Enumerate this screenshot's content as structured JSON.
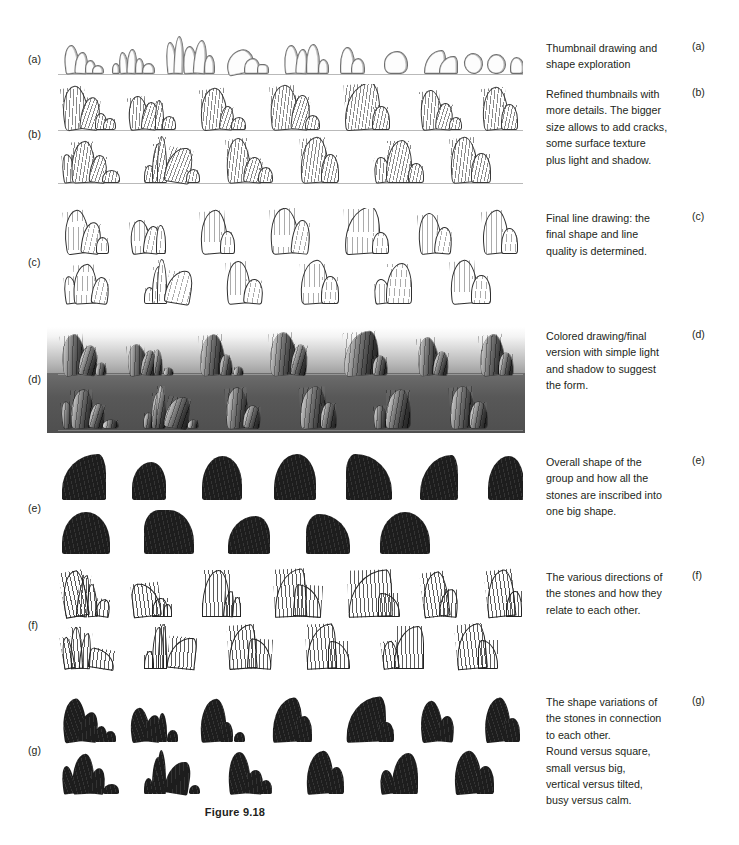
{
  "figure": {
    "label": "Figure 9.18"
  },
  "rows": [
    {
      "key": "a",
      "row_label": "(a)",
      "caption_letter": "(a)",
      "caption_lines": [
        "Thumbnail drawing and",
        "shape exploration"
      ],
      "art_style": "sketch"
    },
    {
      "key": "b",
      "row_label": "(b)",
      "caption_letter": "(b)",
      "caption_lines": [
        "Refined thumbnails with",
        "more details. The bigger",
        "size allows to add cracks,",
        "some surface texture",
        "plus light and shadow."
      ],
      "art_style": "refined"
    },
    {
      "key": "c",
      "row_label": "(c)",
      "caption_letter": "(c)",
      "caption_lines": [
        "Final line drawing: the",
        "final shape and line",
        "quality is determined."
      ],
      "art_style": "line-drawing"
    },
    {
      "key": "d",
      "row_label": "(d)",
      "caption_letter": "(d)",
      "caption_lines": [
        "Colored drawing/final",
        "version with simple light",
        "and shadow to suggest",
        "the form."
      ],
      "art_style": "colored-value"
    },
    {
      "key": "e",
      "row_label": "(e)",
      "caption_letter": "(e)",
      "caption_lines": [
        "Overall shape of the",
        "group and how all the",
        "stones are inscribed into",
        "one big shape."
      ],
      "art_style": "silhouette"
    },
    {
      "key": "f",
      "row_label": "(f)",
      "caption_letter": "(f)",
      "caption_lines": [
        "The various directions of",
        "the stones and how they",
        "relate to each other."
      ],
      "art_style": "direction-lines"
    },
    {
      "key": "g",
      "row_label": "(g)",
      "caption_letter": "(g)",
      "caption_lines": [
        "The shape variations of",
        "the stones in connection",
        "to each other.",
        "Round versus square,",
        "small versus big,",
        "vertical versus tilted,",
        "busy versus calm."
      ],
      "art_style": "shape-variation"
    }
  ],
  "colors": {
    "page_background": "#ffffff",
    "text": "#231f20",
    "ink_dark": "#1d1d1d",
    "ink_mid": "#6e6e6e",
    "ground_line": "#b9b9b9",
    "value_band_light": "#ffffff",
    "value_band_dark": "#3a3a3a"
  }
}
